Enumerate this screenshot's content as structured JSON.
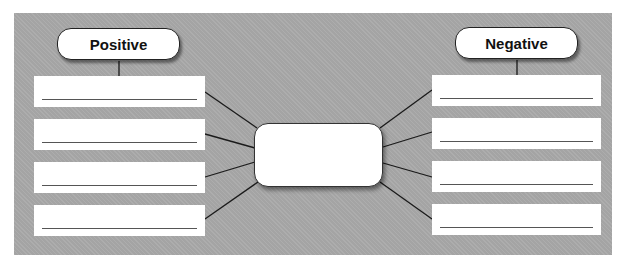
{
  "diagram": {
    "type": "graphic-organizer",
    "positive": {
      "label": "Positive",
      "answer_lines": [
        "",
        "",
        "",
        ""
      ]
    },
    "negative": {
      "label": "Negative",
      "answer_lines": [
        "",
        "",
        "",
        ""
      ]
    },
    "center": {
      "text": ""
    },
    "colors": {
      "panel_background": "#a9a9a9",
      "box_fill": "#ffffff",
      "line_color": "#222222"
    }
  }
}
